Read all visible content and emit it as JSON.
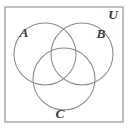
{
  "figure": {
    "name": "three-set-venn-diagram",
    "background_color": "#ffffff",
    "line_color": "#8a8a8a",
    "label_color": "#3c3c3c"
  },
  "universe": {
    "label": "U",
    "label_x": 113,
    "label_y": 19,
    "rect": {
      "x": 5,
      "y": 7,
      "width": 118,
      "height": 115
    }
  },
  "sets": [
    {
      "id": "A",
      "label": "A",
      "label_x": 24,
      "label_y": 37,
      "circle": {
        "cx": 45,
        "cy": 54,
        "r": 31
      }
    },
    {
      "id": "B",
      "label": "B",
      "label_x": 101,
      "label_y": 38,
      "circle": {
        "cx": 82,
        "cy": 54,
        "r": 31
      }
    },
    {
      "id": "C",
      "label": "C",
      "label_x": 60,
      "label_y": 118,
      "circle": {
        "cx": 64,
        "cy": 79,
        "r": 31
      }
    }
  ]
}
